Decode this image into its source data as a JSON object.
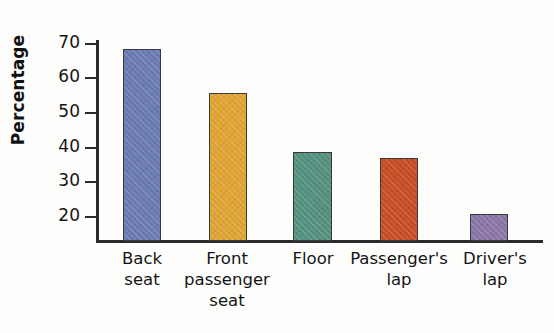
{
  "chart_data": {
    "type": "bar",
    "title": "",
    "xlabel": "",
    "ylabel": "Percentage",
    "categories": [
      "Back seat",
      "Front passenger seat",
      "Floor",
      "Passenger's lap",
      "Driver's lap"
    ],
    "values": [
      68.5,
      55.8,
      38.5,
      36.8,
      20.6
    ],
    "ylim": [
      15,
      73
    ],
    "yticks": [
      20,
      30,
      40,
      50,
      60,
      70
    ],
    "ytick_labels": [
      "20",
      "30",
      "40",
      "50",
      "60",
      "70"
    ],
    "grid": false,
    "legend": "none",
    "bar_colors": [
      "#6b7cb4",
      "#e0a434",
      "#549180",
      "#c74e25",
      "#8a76a8"
    ],
    "bar_border_color": "#3a3a3a",
    "axis_color": "#2b2b2b"
  },
  "axis": {
    "y_title": "Percentage"
  },
  "ticks": {
    "t0": "70",
    "t1": "60",
    "t2": "50",
    "t3": "40",
    "t4": "30",
    "t5": "20"
  },
  "categories": {
    "c0_line1": "Back",
    "c0_line2": "seat",
    "c1_line1": "Front",
    "c1_line2": "passenger",
    "c1_line3": "seat",
    "c2_line1": "Floor",
    "c3_line1": "Passenger's",
    "c3_line2": "lap",
    "c4_line1": "Driver's",
    "c4_line2": "lap"
  }
}
